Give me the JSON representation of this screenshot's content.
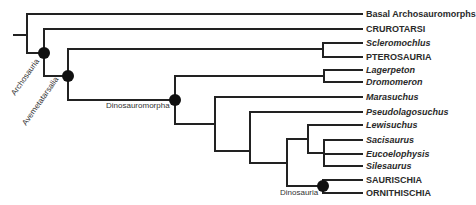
{
  "figure": {
    "type": "cladogram",
    "colors": {
      "branch": "#222222",
      "node": "#111111",
      "text": "#2a2a2a"
    }
  },
  "taxa": [
    {
      "label": "Basal Archosauromorphs",
      "italic": false,
      "y": 14
    },
    {
      "label": "CRUROTARSI",
      "italic": false,
      "y": 29
    },
    {
      "label": "Scleromochlus",
      "italic": true,
      "y": 43
    },
    {
      "label": "PTEROSAURIA",
      "italic": false,
      "y": 57
    },
    {
      "label": "Lagerpeton",
      "italic": true,
      "y": 70
    },
    {
      "label": "Dromomeron",
      "italic": true,
      "y": 82
    },
    {
      "label": "Marasuchus",
      "italic": true,
      "y": 97
    },
    {
      "label": "Pseudolagosuchus",
      "italic": true,
      "y": 112
    },
    {
      "label": "Lewisuchus",
      "italic": true,
      "y": 125
    },
    {
      "label": "Sacisaurus",
      "italic": true,
      "y": 140
    },
    {
      "label": "Eucoelophysis",
      "italic": true,
      "y": 154
    },
    {
      "label": "Silesaurus",
      "italic": true,
      "y": 166
    },
    {
      "label": "SAURISCHIA",
      "italic": false,
      "y": 180
    },
    {
      "label": "ORNITHISCHIA",
      "italic": false,
      "y": 193
    }
  ],
  "clades": [
    {
      "label": "Archosauria",
      "node": [
        44,
        53
      ],
      "rotated": true
    },
    {
      "label": "Avemetatarsalia",
      "node": [
        68,
        76
      ],
      "rotated": true
    },
    {
      "label": "Dinosauromorpha",
      "node": [
        175,
        100
      ],
      "rotated": false
    },
    {
      "label": "Dinosauria",
      "node": [
        323,
        186
      ],
      "rotated": false
    }
  ]
}
